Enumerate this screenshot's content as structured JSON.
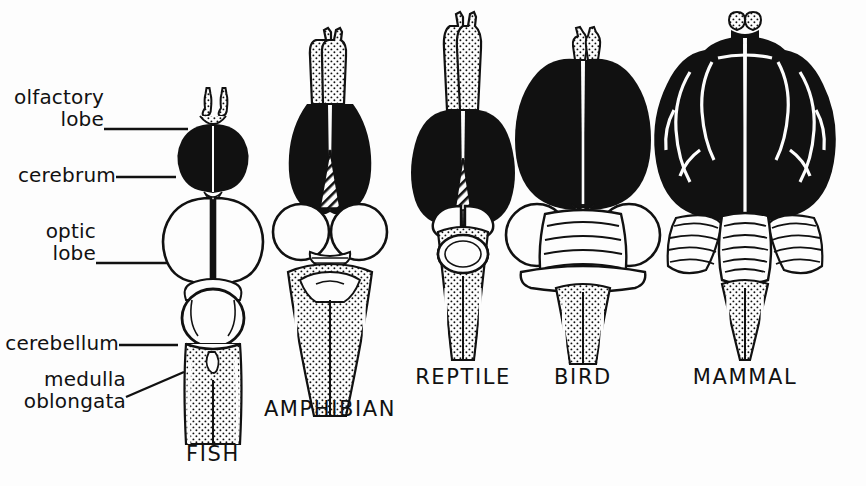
{
  "figure": {
    "background_color": "#fdfdfd",
    "ink_color": "#111111",
    "width": 866,
    "height": 486
  },
  "labels": [
    {
      "id": "olfactory-lobe",
      "text": "olfactory\nlobe",
      "x": 14,
      "y": 86,
      "leader": "horizontal"
    },
    {
      "id": "cerebrum",
      "text": "cerebrum",
      "x": 14,
      "y": 162,
      "leader": "horizontal"
    },
    {
      "id": "optic-lobe",
      "text": "optic\nlobe",
      "x": 14,
      "y": 220,
      "leader": "horizontal"
    },
    {
      "id": "cerebellum",
      "text": "cerebellum",
      "x": 14,
      "y": 330,
      "leader": "horizontal"
    },
    {
      "id": "medulla-oblongata",
      "text": "medulla\noblongata",
      "x": 14,
      "y": 368,
      "leader": "diagonal"
    }
  ],
  "captions": [
    {
      "id": "fish",
      "text": "FISH",
      "x": 213,
      "y": 455
    },
    {
      "id": "amphibian",
      "text": "AMPHIBIAN",
      "x": 330,
      "y": 410
    },
    {
      "id": "reptile",
      "text": "REPTILE",
      "x": 463,
      "y": 378
    },
    {
      "id": "bird",
      "text": "BIRD",
      "x": 583,
      "y": 378
    },
    {
      "id": "mammal",
      "text": "MAMMAL",
      "x": 745,
      "y": 378
    }
  ],
  "specimens": [
    {
      "id": "fish",
      "name": "FISH",
      "center_x": 213,
      "parts": {
        "olfactory_lobe": "small stippled paired bulbs on short stalks",
        "cerebrum": "small solid black paired ovals",
        "optic_lobe": "very large white paired ovals, largest structure",
        "cerebellum": "single round white dome",
        "medulla_oblongata": "stippled tapering stalk"
      }
    },
    {
      "id": "amphibian",
      "name": "AMPHIBIAN",
      "center_x": 330,
      "parts": {
        "olfactory_lobe": "elongated stippled paired lobes, fused to cerebrum",
        "cerebrum": "large solid black elongated paired lobes",
        "optic_lobe": "round white paired circles",
        "diencephalon": "hatched wedge between cerebral hemispheres",
        "cerebellum": "narrow transverse band",
        "medulla_oblongata": "broad stippled triangular stalk"
      }
    },
    {
      "id": "reptile",
      "name": "REPTILE",
      "center_x": 463,
      "parts": {
        "olfactory_lobe": "long slender stippled paired tracts",
        "cerebrum": "broad solid black paired lobes",
        "optic_lobe": "small white lobes partly hidden behind cerebrum",
        "diencephalon": "hatched narrow wedge",
        "cerebellum": "oval ringed body",
        "medulla_oblongata": "stippled narrow paired stalk"
      }
    },
    {
      "id": "bird",
      "name": "BIRD",
      "center_x": 583,
      "parts": {
        "olfactory_lobe": "tiny stippled nubs at anterior tip",
        "cerebrum": "very large solid black heart-shaped mass",
        "optic_lobe": "white rounded lobes displaced laterally",
        "cerebellum": "prominent foliated body with horizontal bands",
        "medulla_oblongata": "stippled paired stalk"
      }
    },
    {
      "id": "mammal",
      "name": "MAMMAL",
      "center_x": 745,
      "parts": {
        "olfactory_lobe": "small stippled paired bulbs at anterior tip",
        "cerebrum": "massive solid black convoluted mass with white sulci",
        "optic_lobe": "not visible from dorsal view, covered by cerebrum",
        "cerebellum": "large foliated lateral lobes with central vermis",
        "medulla_oblongata": "stippled tapering stalk"
      }
    }
  ]
}
